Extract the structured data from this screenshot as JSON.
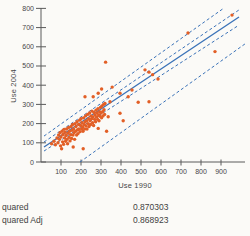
{
  "stats": {
    "rows": [
      {
        "label": "quared",
        "value": "0.870303"
      },
      {
        "label": "quared Adj",
        "value": "0.868923"
      }
    ]
  },
  "chart_data": {
    "type": "scatter",
    "title": "",
    "xlabel": "Use 1990",
    "ylabel": "Use 2004",
    "xlim": [
      0,
      1020
    ],
    "ylim": [
      0,
      802
    ],
    "xticks": [
      100,
      200,
      300,
      400,
      500,
      600,
      700,
      800,
      900
    ],
    "yticks": [
      0,
      100,
      200,
      300,
      400,
      500,
      600,
      700,
      800
    ],
    "grid": false,
    "legend": "none",
    "box": {
      "left": 41,
      "right": 245,
      "top": 8,
      "bottom": 162
    },
    "colors": {
      "points": "#e25f26",
      "lines": "#3a72b8",
      "axis": "#5a5a5a",
      "tick_text": "#474747"
    },
    "fit_line": {
      "name": "linear-fit",
      "x1": 15,
      "y1": 78,
      "x2": 990,
      "y2": 755
    },
    "bands": [
      {
        "name": "confid-fit-upper",
        "x1": 15,
        "y1": 104,
        "x2": 990,
        "y2": 792
      },
      {
        "name": "confid-fit-lower",
        "x1": 15,
        "y1": 57,
        "x2": 990,
        "y2": 713
      },
      {
        "name": "confid-indiv-upper",
        "x1": 15,
        "y1": 135,
        "x2": 915,
        "y2": 802
      },
      {
        "name": "confid-indiv-lower",
        "x1": 195,
        "y1": 0,
        "x2": 1020,
        "y2": 615
      }
    ],
    "points": [
      [
        955,
        765
      ],
      [
        735,
        672
      ],
      [
        870,
        575
      ],
      [
        585,
        432
      ],
      [
        540,
        314
      ],
      [
        520,
        480
      ],
      [
        540,
        468
      ],
      [
        558,
        455
      ],
      [
        486,
        311
      ],
      [
        455,
        375
      ],
      [
        436,
        340
      ],
      [
        411,
        215
      ],
      [
        395,
        358
      ],
      [
        395,
        254
      ],
      [
        356,
        390
      ],
      [
        345,
        314
      ],
      [
        336,
        236
      ],
      [
        328,
        160
      ],
      [
        323,
        520
      ],
      [
        303,
        380
      ],
      [
        286,
        358
      ],
      [
        261,
        340
      ],
      [
        220,
        340
      ],
      [
        286,
        175
      ],
      [
        53,
        95
      ],
      [
        65,
        108
      ],
      [
        72,
        90
      ],
      [
        80,
        125
      ],
      [
        85,
        100
      ],
      [
        88,
        140
      ],
      [
        92,
        118
      ],
      [
        95,
        152
      ],
      [
        98,
        84
      ],
      [
        100,
        130
      ],
      [
        103,
        69
      ],
      [
        105,
        160
      ],
      [
        108,
        105
      ],
      [
        110,
        143
      ],
      [
        113,
        92
      ],
      [
        115,
        170
      ],
      [
        118,
        125
      ],
      [
        120,
        155
      ],
      [
        123,
        108
      ],
      [
        125,
        138
      ],
      [
        128,
        172
      ],
      [
        130,
        118
      ],
      [
        133,
        95
      ],
      [
        135,
        150
      ],
      [
        138,
        180
      ],
      [
        140,
        128
      ],
      [
        143,
        160
      ],
      [
        145,
        110
      ],
      [
        148,
        142
      ],
      [
        150,
        185
      ],
      [
        153,
        122
      ],
      [
        155,
        165
      ],
      [
        158,
        195
      ],
      [
        160,
        140
      ],
      [
        161,
        78
      ],
      [
        163,
        172
      ],
      [
        165,
        152
      ],
      [
        168,
        118
      ],
      [
        170,
        200
      ],
      [
        173,
        160
      ],
      [
        175,
        185
      ],
      [
        178,
        140
      ],
      [
        180,
        210
      ],
      [
        183,
        168
      ],
      [
        185,
        148
      ],
      [
        188,
        195
      ],
      [
        190,
        172
      ],
      [
        193,
        218
      ],
      [
        195,
        158
      ],
      [
        198,
        190
      ],
      [
        200,
        225
      ],
      [
        203,
        172
      ],
      [
        205,
        205
      ],
      [
        208,
        182
      ],
      [
        210,
        160
      ],
      [
        211,
        69
      ],
      [
        213,
        230
      ],
      [
        215,
        195
      ],
      [
        218,
        172
      ],
      [
        220,
        210
      ],
      [
        223,
        240
      ],
      [
        225,
        188
      ],
      [
        228,
        215
      ],
      [
        230,
        172
      ],
      [
        233,
        248
      ],
      [
        235,
        200
      ],
      [
        238,
        225
      ],
      [
        240,
        185
      ],
      [
        243,
        255
      ],
      [
        245,
        215
      ],
      [
        248,
        195
      ],
      [
        250,
        240
      ],
      [
        253,
        225
      ],
      [
        255,
        265
      ],
      [
        258,
        205
      ],
      [
        260,
        235
      ],
      [
        263,
        190
      ],
      [
        265,
        258
      ],
      [
        268,
        222
      ],
      [
        270,
        245
      ],
      [
        273,
        210
      ],
      [
        275,
        270
      ],
      [
        278,
        235
      ],
      [
        280,
        255
      ],
      [
        283,
        222
      ],
      [
        285,
        278
      ],
      [
        288,
        245
      ],
      [
        290,
        215
      ],
      [
        293,
        262
      ],
      [
        295,
        238
      ],
      [
        298,
        285
      ],
      [
        300,
        255
      ],
      [
        303,
        230
      ],
      [
        305,
        292
      ],
      [
        308,
        262
      ],
      [
        310,
        240
      ],
      [
        313,
        300
      ],
      [
        315,
        272
      ],
      [
        318,
        248
      ],
      [
        320,
        305
      ]
    ]
  }
}
